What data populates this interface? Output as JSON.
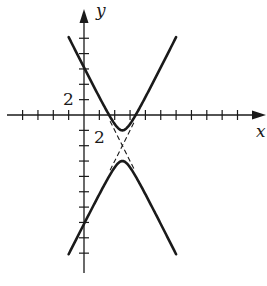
{
  "chart_data": {
    "type": "line",
    "title": "",
    "xlabel": "x",
    "ylabel": "y",
    "tick_labels": {
      "x": "2",
      "y": "2"
    },
    "tick_step": 1,
    "label_step": 2,
    "xlim": [
      -5,
      12
    ],
    "ylim": [
      -10,
      7
    ],
    "grid": false,
    "legend": null,
    "curve": {
      "kind": "hyperbola",
      "equation": "(y + 2)^2 - 4(x - 2.5)^2 = 1",
      "center": [
        2.5,
        -2
      ],
      "vertices": [
        [
          2.5,
          -1
        ],
        [
          2.5,
          -3
        ]
      ],
      "asymptote_slopes": [
        2,
        -2
      ],
      "x_range": [
        -1,
        6
      ]
    },
    "series": [
      {
        "name": "upper branch",
        "style": "solid",
        "x": [
          -1,
          0,
          1,
          2,
          2.5,
          3,
          4,
          5,
          6
        ],
        "y": [
          5.07,
          3.1,
          1.16,
          -0.59,
          -1.0,
          -0.59,
          1.16,
          3.1,
          5.07
        ]
      },
      {
        "name": "lower branch",
        "style": "solid",
        "x": [
          -1,
          0,
          1,
          2,
          2.5,
          3,
          4,
          5,
          6
        ],
        "y": [
          -9.07,
          -7.1,
          -5.16,
          -3.41,
          -3.0,
          -3.41,
          -5.16,
          -7.1,
          -9.07
        ]
      },
      {
        "name": "asymptote 1",
        "style": "dashed",
        "x": [
          1.7,
          3.3
        ],
        "y": [
          -3.6,
          -0.4
        ]
      },
      {
        "name": "asymptote 2",
        "style": "dashed",
        "x": [
          1.7,
          3.3
        ],
        "y": [
          -0.4,
          -3.6
        ]
      }
    ]
  }
}
